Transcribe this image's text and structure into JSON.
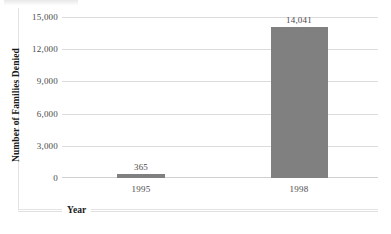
{
  "chart_data": {
    "type": "bar",
    "title": "",
    "categories": [
      "1995",
      "1998"
    ],
    "values": [
      365,
      14041
    ],
    "data_labels": [
      "365",
      "14,041"
    ],
    "xlabel": "Year",
    "ylabel": "Number of Families Denied",
    "ylim": [
      0,
      15000
    ],
    "ytick_values": [
      0,
      3000,
      6000,
      9000,
      12000,
      15000
    ],
    "ytick_labels": [
      "0",
      "3,000",
      "6,000",
      "9,000",
      "12,000",
      "15,000"
    ],
    "grid": "horizontal",
    "legend": "none",
    "series": [
      {
        "name": "Number of Families Denied",
        "values": [
          365,
          14041
        ],
        "color": "#808080"
      }
    ]
  },
  "colors": {
    "bar_fill": "#808080",
    "gridline": "#dcdcdc",
    "axis_text": "#4a4a4a",
    "title_text": "#1a1a1a",
    "frame": "#e3e3e3",
    "background": "#ffffff"
  }
}
